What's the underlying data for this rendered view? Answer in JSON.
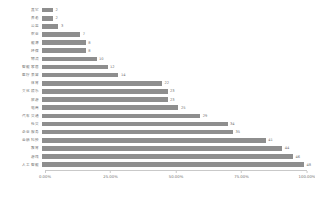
{
  "chart_data": {
    "type": "bar",
    "orientation": "horizontal",
    "title": "",
    "subtitle": "",
    "xlabel": "",
    "ylabel": "",
    "xlim": [
      0,
      100
    ],
    "grid": false,
    "legend": null,
    "bar_color": "#8e8e8e",
    "axis_color": "#c9c9c9",
    "text_color": "#6f6f6f",
    "background": "#ffffff",
    "value_max": 48,
    "xtick_labels": [
      "0.00%",
      "25.00%",
      "50.00%",
      "75.00%",
      "100.00%"
    ],
    "xtick_values": [
      0,
      25,
      50,
      75,
      100
    ],
    "categories": [
      "其它",
      "养老",
      "公益",
      "农业",
      "能源",
      "环保",
      "物流",
      "智能家居",
      "医疗美容",
      "体育",
      "文化娱乐",
      "旅游",
      "电商",
      "汽车交通",
      "社交",
      "企业服务",
      "金融科技",
      "教育",
      "游戏",
      "人工智能"
    ],
    "values": [
      2,
      2,
      3,
      7,
      8,
      8,
      10,
      12,
      14,
      22,
      23,
      23,
      25,
      29,
      34,
      35,
      41,
      44,
      46,
      48
    ],
    "value_labels": [
      "2",
      "2",
      "3",
      "7",
      "8",
      "8",
      "10",
      "12",
      "14",
      "22",
      "23",
      "23",
      "25",
      "29",
      "34",
      "35",
      "41",
      "44",
      "46",
      "48"
    ]
  }
}
